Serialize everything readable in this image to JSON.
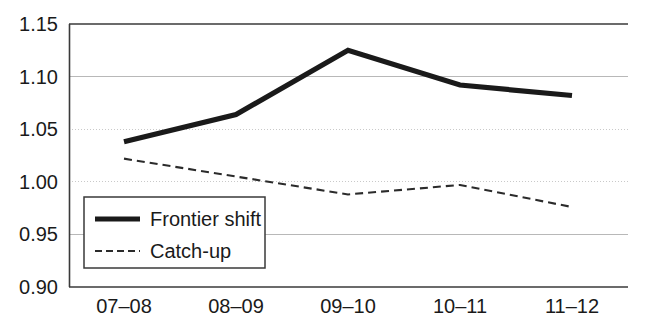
{
  "chart_data": {
    "type": "line",
    "title": "",
    "subtitle": "",
    "xlabel": "",
    "ylabel": "",
    "categories": [
      "07–08",
      "08–09",
      "09–10",
      "10–11",
      "11–12"
    ],
    "series": [
      {
        "name": "Frontier shift",
        "style": "solid-thick",
        "color": "#1a1a1a",
        "values": [
          1.038,
          1.064,
          1.125,
          1.092,
          1.082
        ]
      },
      {
        "name": "Catch-up",
        "style": "dashed-thin",
        "color": "#2b2b2b",
        "values": [
          1.022,
          1.005,
          0.988,
          0.997,
          0.976
        ]
      }
    ],
    "ylim": [
      0.9,
      1.15
    ],
    "yticks": [
      "0.90",
      "0.95",
      "1.00",
      "1.05",
      "1.10",
      "1.15"
    ],
    "ytick_values": [
      0.9,
      0.95,
      1.0,
      1.05,
      1.1,
      1.15
    ],
    "grid": true,
    "legend_position": "bottom-left"
  },
  "axes": {
    "y_tick_labels": [
      "1.15",
      "1.10",
      "1.05",
      "1.00",
      "0.95",
      "0.90"
    ],
    "x_tick_labels": [
      "07–08",
      "08–09",
      "09–10",
      "10–11",
      "11–12"
    ]
  },
  "legend": {
    "entries": [
      {
        "label": "Frontier shift"
      },
      {
        "label": "Catch-up"
      }
    ]
  },
  "colors": {
    "background": "#ffffff",
    "axis": "#3a3a3a",
    "gridline": "#b8b8b8",
    "gridline_dotted": "#c9c9c9",
    "frontier": "#1a1a1a",
    "catchup": "#2b2b2b",
    "text": "#1a1a1a"
  }
}
